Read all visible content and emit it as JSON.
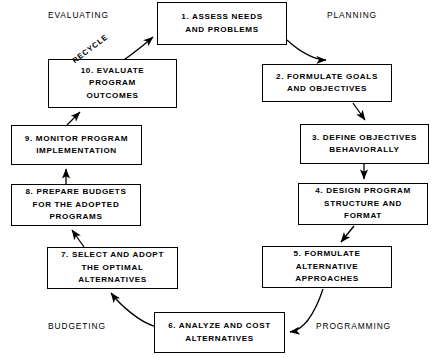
{
  "diagram": {
    "line_color": "#000000",
    "background_color": "#ffffff",
    "quadrant_labels": {
      "evaluating": "EVALUATING",
      "planning": "PLANNING",
      "programming": "PROGRAMMING",
      "budgeting": "BUDGETING"
    },
    "edge_labels": {
      "recycle": "RECYCLE"
    },
    "nodes": [
      {
        "id": "1",
        "number": "1.",
        "lines": [
          "1.  ASSESS NEEDS",
          "AND PROBLEMS"
        ]
      },
      {
        "id": "2",
        "number": "2.",
        "lines": [
          "2.  FORMULATE GOALS",
          "AND OBJECTIVES"
        ]
      },
      {
        "id": "3",
        "number": "3.",
        "lines": [
          "3.  DEFINE OBJECTIVES",
          "BEHAVIORALLY"
        ]
      },
      {
        "id": "4",
        "number": "4.",
        "lines": [
          "4.  DESIGN PROGRAM",
          "STRUCTURE AND",
          "FORMAT"
        ]
      },
      {
        "id": "5",
        "number": "5.",
        "lines": [
          "5.  FORMULATE",
          "ALTERNATIVE",
          "APPROACHES"
        ]
      },
      {
        "id": "6",
        "number": "6.",
        "lines": [
          "6.  ANALYZE AND COST",
          "ALTERNATIVES"
        ]
      },
      {
        "id": "7",
        "number": "7.",
        "lines": [
          "7.  SELECT AND ADOPT",
          "THE OPTIMAL",
          "ALTERNATIVES"
        ]
      },
      {
        "id": "8",
        "number": "8.",
        "lines": [
          "8.  PREPARE BUDGETS",
          "FOR THE ADOPTED",
          "PROGRAMS"
        ]
      },
      {
        "id": "9",
        "number": "9.",
        "lines": [
          "9.  MONITOR PROGRAM",
          "IMPLEMENTATION"
        ]
      },
      {
        "id": "10",
        "number": "10.",
        "lines": [
          "10.  EVALUATE",
          "PROGRAM",
          "OUTCOMES"
        ]
      }
    ],
    "edges": [
      {
        "from": "1",
        "to": "2",
        "label": ""
      },
      {
        "from": "2",
        "to": "3",
        "label": ""
      },
      {
        "from": "3",
        "to": "4",
        "label": ""
      },
      {
        "from": "4",
        "to": "5",
        "label": ""
      },
      {
        "from": "5",
        "to": "6",
        "label": ""
      },
      {
        "from": "6",
        "to": "7",
        "label": ""
      },
      {
        "from": "7",
        "to": "8",
        "label": ""
      },
      {
        "from": "8",
        "to": "9",
        "label": ""
      },
      {
        "from": "9",
        "to": "10",
        "label": ""
      },
      {
        "from": "10",
        "to": "1",
        "label": "RECYCLE"
      }
    ]
  }
}
